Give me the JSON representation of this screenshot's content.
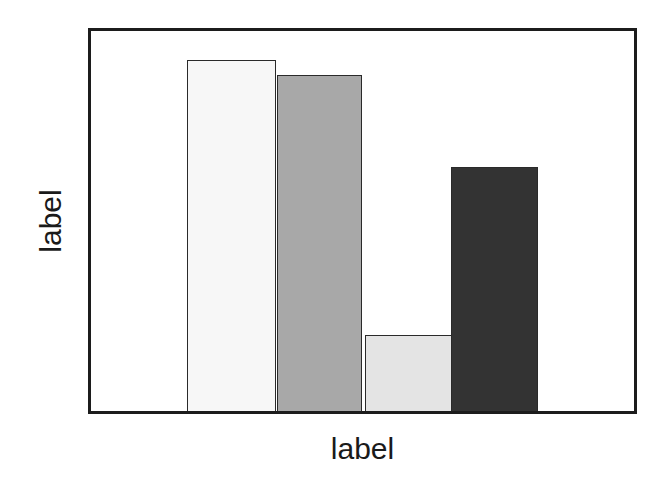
{
  "chart_data": {
    "type": "bar",
    "title": "",
    "subtitle": "",
    "xlabel": "label",
    "ylabel": "label",
    "categories": [
      "1",
      "2",
      "3",
      "4"
    ],
    "values": [
      92.5,
      88.3,
      20.0,
      64.2
    ],
    "ylim": [
      0,
      100
    ],
    "xlim": [
      0,
      100
    ],
    "grid": false,
    "legend": false,
    "legend_position": "none",
    "tick_labels_x": [],
    "tick_labels_y": [],
    "annotations": [],
    "bars": [
      {
        "name": "bar-1",
        "value": 92.5,
        "fill": "#f7f7f7",
        "edge": "#2a2a2a",
        "left_pct": 17.7,
        "width_pct": 16.4
      },
      {
        "name": "bar-2",
        "value": 88.3,
        "fill": "#a8a8a8",
        "edge": "#2a2a2a",
        "left_pct": 34.2,
        "width_pct": 15.8
      },
      {
        "name": "bar-3",
        "value": 20.0,
        "fill": "#e4e4e4",
        "edge": "#2a2a2a",
        "left_pct": 50.4,
        "width_pct": 16.4
      },
      {
        "name": "bar-4",
        "value": 64.2,
        "fill": "#333333",
        "edge": "#2a2a2a",
        "left_pct": 66.3,
        "width_pct": 16.0
      }
    ]
  },
  "figure": {
    "background": "#ffffff",
    "frame_color": "#1c1c1c",
    "axis_label_color": "#1a1a1a"
  },
  "axes": {
    "y_label": "label",
    "x_label": "label"
  }
}
